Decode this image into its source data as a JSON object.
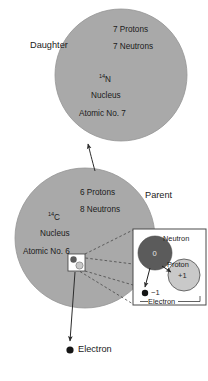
{
  "diagram": {
    "colors": {
      "nucleus_fill": "#a9a9a9",
      "nucleus_stroke": "#8f8f8f",
      "neutron_fill": "#5b5b5b",
      "proton_fill": "#c9c9c9",
      "electron_fill": "#1a1a1a",
      "line": "#3a3a3a",
      "inset_border": "#4a4a4a",
      "background": "#ffffff"
    }
  },
  "daughter": {
    "role_label": "Daughter",
    "protons": "7 Protons",
    "neutrons": "7 Neutrons",
    "isotope_mass": "14",
    "isotope_symbol": "N",
    "nucleus_label": "Nucleus",
    "atomic_no": "Atomic No. 7"
  },
  "parent": {
    "role_label": "Parent",
    "protons": "6 Protons",
    "neutrons": "8 Neutrons",
    "isotope_mass": "14",
    "isotope_symbol": "C",
    "nucleus_label": "Nucleus",
    "atomic_no": "Atomic No. 6"
  },
  "inset": {
    "neutron_label": "Neutron",
    "neutron_charge": "0",
    "proton_label": "Proton",
    "proton_charge": "+1",
    "electron_label": "Electron",
    "electron_charge": "−1"
  },
  "emitted": {
    "electron_label": "Electron"
  }
}
